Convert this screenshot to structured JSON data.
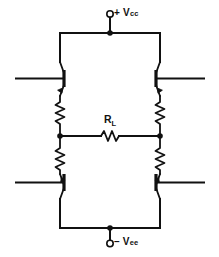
{
  "diagram": {
    "type": "bridge-push-pull-amplifier-schematic",
    "background_color": "#ffffff",
    "line_color": "#111111"
  },
  "labels": {
    "supply_positive": {
      "sign": "+ V",
      "subscript": "cc",
      "name": "positive-supply-rail-label"
    },
    "supply_negative": {
      "sign": "– V",
      "subscript": "ee",
      "name": "negative-supply-rail-label"
    },
    "load_resistor": {
      "symbol": "R",
      "subscript": "L",
      "name": "load-resistor-label"
    }
  },
  "components": {
    "transistors": [
      {
        "id": "Q1",
        "position": "upper-left",
        "type": "npn",
        "base_side": "left"
      },
      {
        "id": "Q2",
        "position": "upper-right",
        "type": "npn",
        "base_side": "right"
      },
      {
        "id": "Q3",
        "position": "lower-left",
        "type": "npn",
        "base_side": "left"
      },
      {
        "id": "Q4",
        "position": "lower-right",
        "type": "npn",
        "base_side": "right"
      }
    ],
    "emitter_resistors": [
      {
        "id": "RE1",
        "position": "upper-left"
      },
      {
        "id": "RE2",
        "position": "upper-right"
      },
      {
        "id": "RE3",
        "position": "lower-left"
      },
      {
        "id": "RE4",
        "position": "lower-right"
      }
    ],
    "load": {
      "id": "RL",
      "orientation": "horizontal",
      "position": "center-bridge"
    },
    "terminals": [
      {
        "id": "T1",
        "label": "positive-supply",
        "style": "open-circle"
      },
      {
        "id": "T2",
        "label": "negative-supply",
        "style": "open-circle"
      }
    ],
    "junction_dots": [
      {
        "id": "N1",
        "location": "top-rail-center"
      },
      {
        "id": "N2",
        "location": "left-bridge-node"
      },
      {
        "id": "N3",
        "location": "right-bridge-node"
      },
      {
        "id": "N4",
        "location": "bottom-rail-center"
      }
    ],
    "input_leads": [
      {
        "id": "IN1",
        "position": "upper-left",
        "direction": "left-edge"
      },
      {
        "id": "IN2",
        "position": "upper-right",
        "direction": "right-edge"
      },
      {
        "id": "IN3",
        "position": "lower-left",
        "direction": "left-edge"
      },
      {
        "id": "IN4",
        "position": "lower-right",
        "direction": "right-edge"
      }
    ]
  }
}
